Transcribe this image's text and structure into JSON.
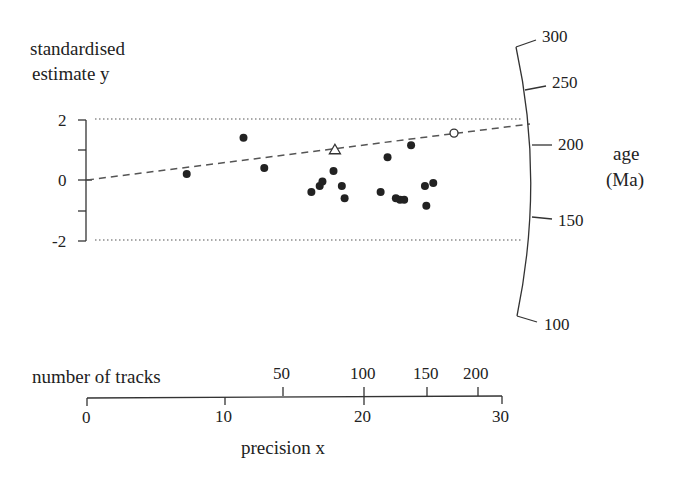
{
  "chart_data": {
    "type": "scatter",
    "subtype": "radial plot",
    "title": "",
    "ylabel": "standardised estimate y",
    "xlabel": "precision x",
    "secondary_x_label": "number of tracks",
    "radial_label": "age (Ma)",
    "y_ticks": [
      "2",
      "0",
      "-2"
    ],
    "y_range": [
      -2,
      2
    ],
    "x_ticks": [
      "0",
      "10",
      "20",
      "30"
    ],
    "x_range": [
      0,
      30
    ],
    "track_ticks": [
      "50",
      "100",
      "150",
      "200"
    ],
    "age_ticks": [
      "300",
      "250",
      "200",
      "150",
      "100"
    ],
    "reference_lines": {
      "dotted_bands": [
        2,
        -2
      ],
      "dashed_line": {
        "from": {
          "x": 0,
          "y": 0
        },
        "to_age": 210
      }
    },
    "points": [
      {
        "x": 7.2,
        "y": 0.2,
        "marker": "filled-circle"
      },
      {
        "x": 11.3,
        "y": 1.4,
        "marker": "filled-circle"
      },
      {
        "x": 12.8,
        "y": 0.4,
        "marker": "filled-circle"
      },
      {
        "x": 16.2,
        "y": -0.4,
        "marker": "filled-circle"
      },
      {
        "x": 16.8,
        "y": -0.2,
        "marker": "filled-circle"
      },
      {
        "x": 17.0,
        "y": -0.05,
        "marker": "filled-circle"
      },
      {
        "x": 17.8,
        "y": 0.3,
        "marker": "filled-circle"
      },
      {
        "x": 18.4,
        "y": -0.2,
        "marker": "filled-circle"
      },
      {
        "x": 18.6,
        "y": -0.6,
        "marker": "filled-circle"
      },
      {
        "x": 17.9,
        "y": 1.0,
        "marker": "open-triangle"
      },
      {
        "x": 21.2,
        "y": -0.4,
        "marker": "filled-circle"
      },
      {
        "x": 21.7,
        "y": 0.75,
        "marker": "filled-circle"
      },
      {
        "x": 22.3,
        "y": -0.6,
        "marker": "filled-circle"
      },
      {
        "x": 22.6,
        "y": -0.65,
        "marker": "filled-circle"
      },
      {
        "x": 22.9,
        "y": -0.65,
        "marker": "filled-circle"
      },
      {
        "x": 23.4,
        "y": 1.15,
        "marker": "filled-circle"
      },
      {
        "x": 24.4,
        "y": -0.2,
        "marker": "filled-circle"
      },
      {
        "x": 24.5,
        "y": -0.85,
        "marker": "filled-circle"
      },
      {
        "x": 25.0,
        "y": -0.1,
        "marker": "filled-circle"
      },
      {
        "x": 26.5,
        "y": 1.55,
        "marker": "open-circle"
      }
    ],
    "grid": false,
    "legend": null
  },
  "labels": {
    "ylabel_line1": "standardised",
    "ylabel_line2": "estimate y",
    "xlabel": "precision x",
    "tracks_label": "number of tracks",
    "age_line1": "age",
    "age_line2": "(Ma)"
  }
}
